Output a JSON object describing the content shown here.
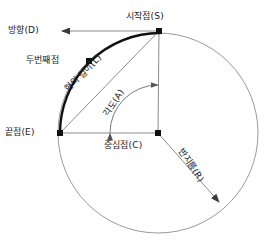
{
  "diagram": {
    "colors": {
      "circle_stroke": "#9a9a9a",
      "arc_stroke": "#111111",
      "line_stroke": "#8c8c8c",
      "point_fill": "#111111",
      "text": "#1a1a1a",
      "background": "#ffffff"
    },
    "labels": {
      "direction": "방향(D)",
      "start_point": "시작점(S)",
      "second_point": "두번째점",
      "chord_length": "현의 길이(L)",
      "angle": "각도(A)",
      "end_point": "끝점(E)",
      "center_point": "중심점(C)",
      "radius": "반지름(R)"
    },
    "geometry": {
      "center": {
        "x": 158,
        "y": 133
      },
      "radius": 100,
      "start_point": {
        "x": 160,
        "y": 31
      },
      "end_point": {
        "x": 60,
        "y": 133
      },
      "second_point": {
        "x": 89,
        "y": 61
      },
      "radius_arrow_end": {
        "x": 219,
        "y": 202
      },
      "direction_arrow_end": {
        "x": 62,
        "y": 31
      },
      "angle_arc_radius": 48,
      "arc_span_degrees": 90
    }
  }
}
